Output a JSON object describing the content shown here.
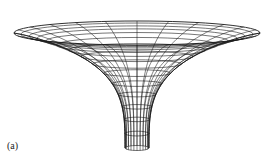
{
  "figure": {
    "label": "(a)",
    "line_color": "#1a1a1a",
    "background": "#ffffff",
    "geometry": {
      "center_x": 137,
      "rim_y": 33,
      "rim_rx": 123,
      "rim_ry": 12,
      "bottom_y": 148,
      "bottom_rx": 12,
      "bottom_ry": 2,
      "rings": 16,
      "meridians": 24
    }
  }
}
